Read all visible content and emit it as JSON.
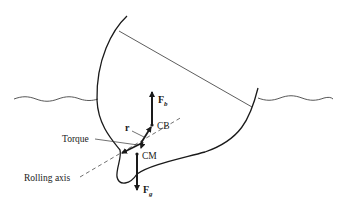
{
  "diagram": {
    "labels": {
      "buoyant_force": "F",
      "buoyant_force_sub": "b",
      "gravity_force": "F",
      "gravity_force_sub": "g",
      "center_of_buoyancy": "CB",
      "center_of_mass": "CM",
      "lever_arm": "r",
      "torque": "Torque",
      "rolling_axis": "Rolling axis"
    },
    "colors": {
      "line": "#1a1a1a",
      "background": "#ffffff"
    }
  }
}
